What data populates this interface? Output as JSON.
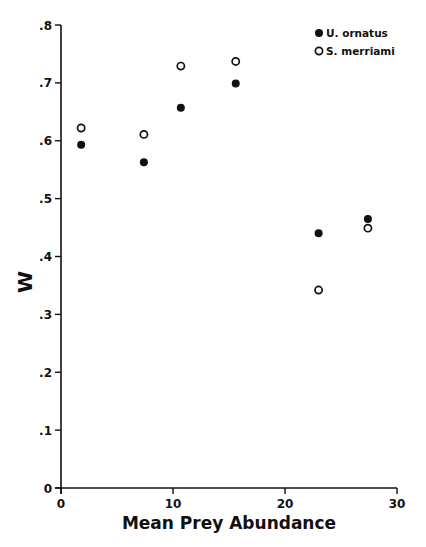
{
  "chart_data": {
    "type": "scatter",
    "title": "",
    "xlabel": "Mean Prey Abundance",
    "ylabel": "W",
    "xlim": [
      0,
      30
    ],
    "ylim": [
      0,
      0.8
    ],
    "x_ticks": [
      "0",
      "10",
      "20",
      "30"
    ],
    "y_ticks": [
      "0",
      ".1",
      ".2",
      ".3",
      ".4",
      ".5",
      ".6",
      ".7",
      ".8"
    ],
    "grid": false,
    "legend_position": "upper right",
    "series": [
      {
        "name": "U. ornatus",
        "marker": "filled-circle",
        "points": [
          [
            1.8,
            0.593
          ],
          [
            7.4,
            0.563
          ],
          [
            10.7,
            0.657
          ],
          [
            15.6,
            0.699
          ],
          [
            23.0,
            0.44
          ],
          [
            27.4,
            0.465
          ]
        ]
      },
      {
        "name": "S. merriami",
        "marker": "open-star-circle",
        "points": [
          [
            1.8,
            0.622
          ],
          [
            7.4,
            0.611
          ],
          [
            10.7,
            0.729
          ],
          [
            15.6,
            0.737
          ],
          [
            23.0,
            0.342
          ],
          [
            27.4,
            0.449
          ]
        ]
      }
    ]
  }
}
